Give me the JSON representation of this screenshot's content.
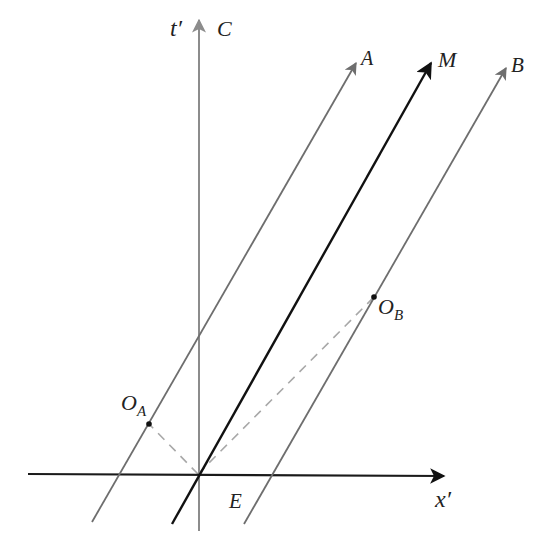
{
  "diagram": {
    "type": "spacetime-diagram",
    "axes": {
      "x_axis": {
        "label": "x′",
        "color": "#1a1a1a"
      },
      "t_axis": {
        "label": "t′",
        "line_label": "C",
        "color": "#8c8c8c"
      }
    },
    "worldlines": [
      {
        "id": "A",
        "label": "A",
        "color": "#6e6e6e"
      },
      {
        "id": "M",
        "label": "M",
        "color": "#111111"
      },
      {
        "id": "B",
        "label": "B",
        "color": "#6e6e6e"
      }
    ],
    "points": [
      {
        "id": "OA",
        "label": "O",
        "subscript": "A"
      },
      {
        "id": "OB",
        "label": "O",
        "subscript": "B"
      },
      {
        "id": "E",
        "label": "E"
      }
    ],
    "dashed_color": "#a8a8a8"
  }
}
